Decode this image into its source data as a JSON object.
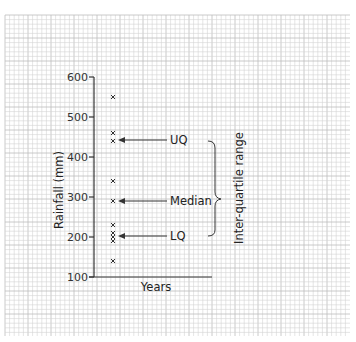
{
  "chart_data": {
    "type": "scatter",
    "title": "",
    "xlabel": "Years",
    "ylabel": "Rainfall (mm)",
    "ylim": [
      100,
      600
    ],
    "yticks": [
      100,
      200,
      300,
      400,
      500,
      600
    ],
    "grid": true,
    "series": [
      {
        "name": "Rainfall",
        "marker": "x",
        "values": [
          550,
          460,
          440,
          340,
          290,
          230,
          210,
          200,
          190,
          140
        ]
      }
    ],
    "annotations": [
      {
        "label": "UQ",
        "value": 440
      },
      {
        "label": "Median",
        "value": 290
      },
      {
        "label": "LQ",
        "value": 200
      },
      {
        "label": "Inter-quartile range",
        "from": 200,
        "to": 440,
        "type": "brace"
      }
    ]
  },
  "labels": {
    "xlabel": "Years",
    "ylabel": "Rainfall (mm)",
    "uq": "UQ",
    "median": "Median",
    "lq": "LQ",
    "iqr": "Inter-quartile range",
    "ticks": [
      "600",
      "500",
      "400",
      "300",
      "200",
      "100"
    ]
  }
}
